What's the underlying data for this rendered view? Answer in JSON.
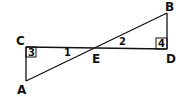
{
  "diagram": {
    "type": "geometry",
    "colors": {
      "stroke": "#111111",
      "background": "#ffffff"
    },
    "points": {
      "A": {
        "label": "A",
        "x": 26,
        "y": 81
      },
      "B": {
        "label": "B",
        "x": 167,
        "y": 13
      },
      "C": {
        "label": "C",
        "x": 26,
        "y": 47
      },
      "D": {
        "label": "D",
        "x": 167,
        "y": 49
      },
      "E": {
        "label": "E",
        "x": 96,
        "y": 48
      }
    },
    "segments": [
      "AB",
      "CD",
      "AC",
      "BD"
    ],
    "angles": [
      {
        "label": "1",
        "at": "E",
        "between": "EC, EA"
      },
      {
        "label": "2",
        "at": "E",
        "between": "ED, EB"
      },
      {
        "label": "3",
        "at": "C",
        "right_angle": true
      },
      {
        "label": "4",
        "at": "D",
        "right_angle": true
      }
    ]
  }
}
